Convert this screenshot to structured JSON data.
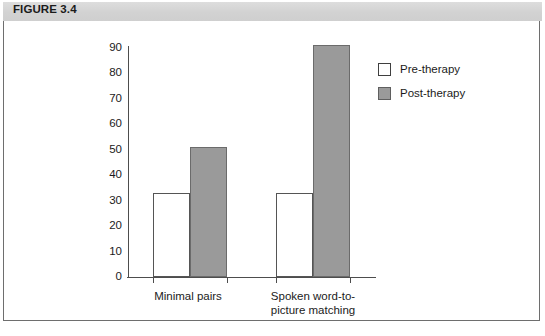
{
  "figure": {
    "header_label": "FIGURE 3.4"
  },
  "chart_data": {
    "type": "bar",
    "title": "",
    "xlabel": "",
    "ylabel": "",
    "ylim": [
      0,
      90
    ],
    "y_ticks": [
      90,
      80,
      70,
      60,
      50,
      40,
      30,
      20,
      10,
      0
    ],
    "grid": false,
    "legend_position": "right",
    "categories": [
      "Minimal pairs",
      "Spoken word-to-picture matching"
    ],
    "series": [
      {
        "name": "Pre-therapy",
        "color": "#ffffff",
        "values": [
          33,
          33
        ]
      },
      {
        "name": "Post-therapy",
        "color": "#9a9a9a",
        "values": [
          51,
          91
        ]
      }
    ]
  }
}
